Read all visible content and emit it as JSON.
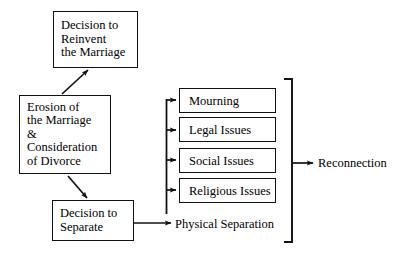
{
  "diagram": {
    "stroke_color": "#111111",
    "background_color": "#ffffff",
    "nodes": {
      "reinvent": {
        "lines": [
          "Decision to",
          "Reinvent",
          "the Marriage"
        ]
      },
      "erosion": {
        "lines": [
          "Erosion of",
          "the Marriage",
          "&",
          "Consideration",
          "of Divorce"
        ]
      },
      "separate": {
        "lines": [
          "Decision to",
          "Separate"
        ]
      },
      "mourning": {
        "label": "Mourning"
      },
      "legal": {
        "label": "Legal Issues"
      },
      "social": {
        "label": "Social Issues"
      },
      "religious": {
        "label": "Religious Issues"
      }
    },
    "labels": {
      "physical_separation": "Physical Separation",
      "reconnection": "Reconnection"
    }
  }
}
